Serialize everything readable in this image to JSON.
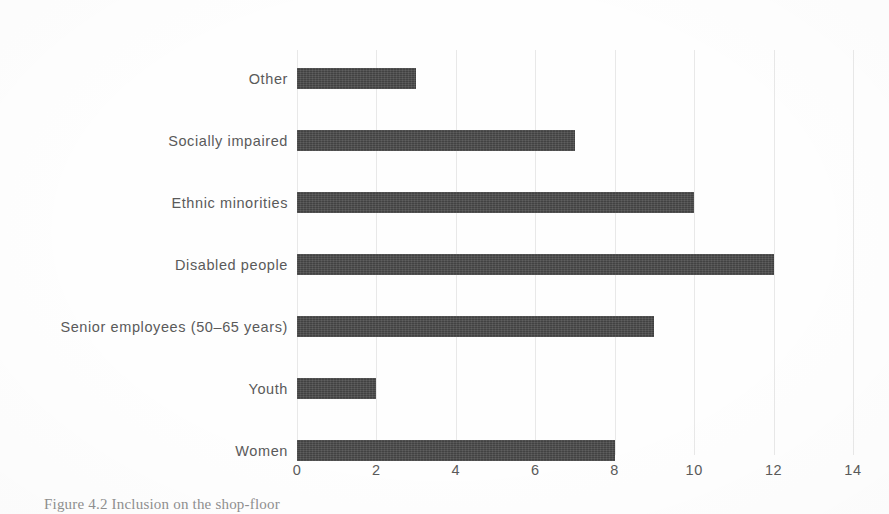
{
  "figure": {
    "caption": "Figure 4.2 Inclusion on the shop-floor"
  },
  "chart_data": {
    "type": "bar",
    "orientation": "horizontal",
    "title": "",
    "xlabel": "",
    "ylabel": "",
    "categories": [
      "Women",
      "Youth",
      "Senior employees (50–65 years)",
      "Disabled people",
      "Ethnic minorities",
      "Socially impaired",
      "Other"
    ],
    "values": [
      8,
      2,
      9,
      12,
      10,
      7,
      3
    ],
    "xlim": [
      0,
      14
    ],
    "xticks": [
      0,
      2,
      4,
      6,
      8,
      10,
      12,
      14
    ],
    "xtick_labels": [
      "0",
      "2",
      "4",
      "6",
      "8",
      "10",
      "12",
      "14"
    ],
    "grid": true,
    "grid_axis": "x",
    "legend": false,
    "bar_color": "#4a4a4a",
    "text_color": "#5a5a5a",
    "grid_color": "#e8e8e8",
    "background_color": "#fefefe"
  }
}
